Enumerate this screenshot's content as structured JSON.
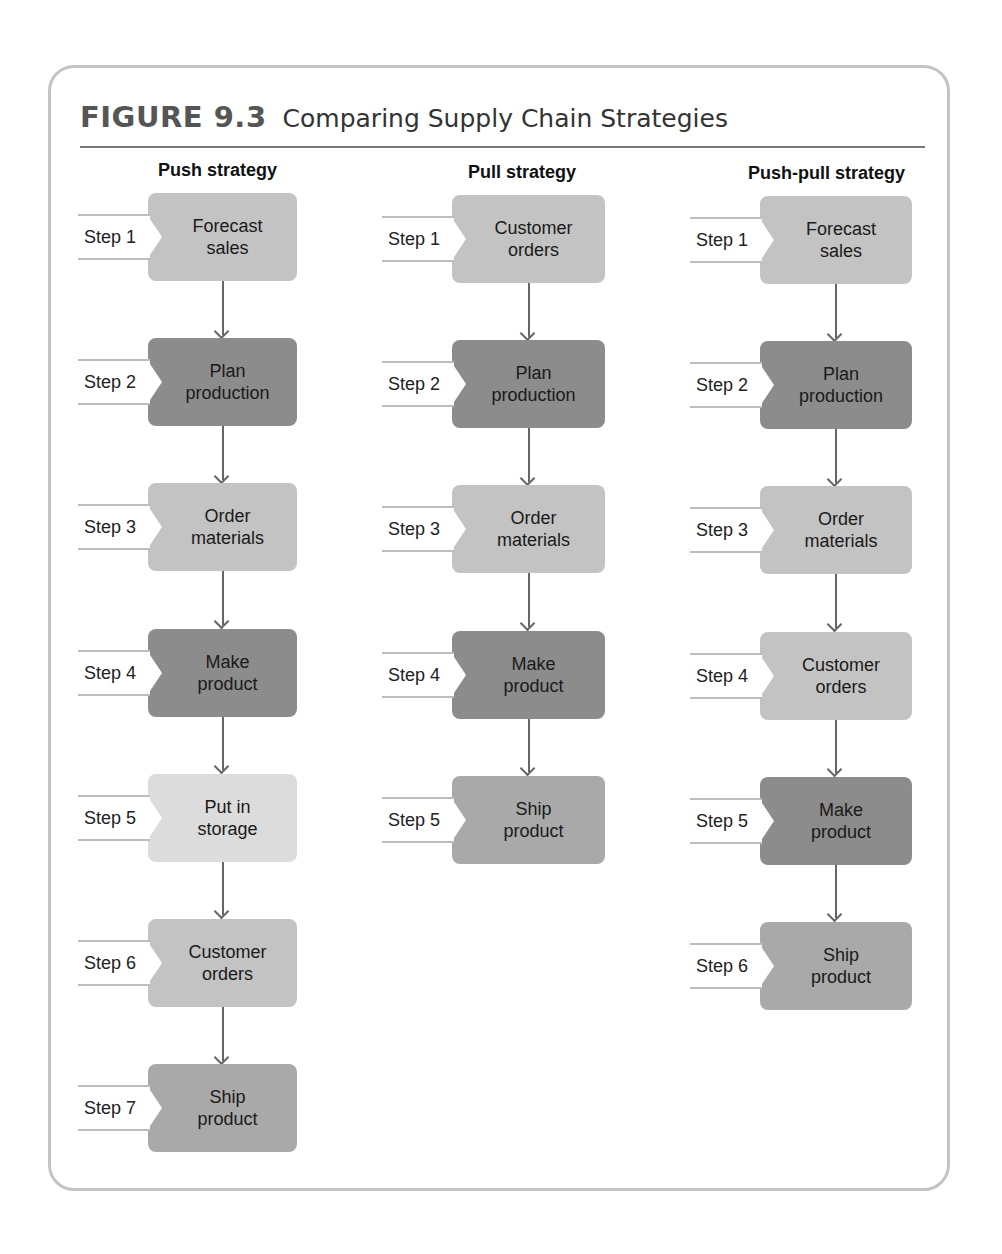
{
  "figure": {
    "number": "FIGURE 9.3",
    "title": "Comparing Supply Chain Strategies"
  },
  "colors": {
    "dark": "#8c8c8c",
    "medium": "#a9a9a9",
    "light": "#c3c3c3",
    "lightest": "#dcdcdc"
  },
  "columns": [
    {
      "heading": "Push strategy",
      "steps": [
        {
          "label": "Step 1",
          "text": "Forecast\nsales",
          "shade": "light"
        },
        {
          "label": "Step 2",
          "text": "Plan\nproduction",
          "shade": "dark"
        },
        {
          "label": "Step 3",
          "text": "Order\nmaterials",
          "shade": "light"
        },
        {
          "label": "Step 4",
          "text": "Make\nproduct",
          "shade": "dark"
        },
        {
          "label": "Step 5",
          "text": "Put in\nstorage",
          "shade": "lightest"
        },
        {
          "label": "Step 6",
          "text": "Customer\norders",
          "shade": "light"
        },
        {
          "label": "Step 7",
          "text": "Ship\nproduct",
          "shade": "medium"
        }
      ]
    },
    {
      "heading": "Pull strategy",
      "steps": [
        {
          "label": "Step 1",
          "text": "Customer\norders",
          "shade": "light"
        },
        {
          "label": "Step 2",
          "text": "Plan\nproduction",
          "shade": "dark"
        },
        {
          "label": "Step 3",
          "text": "Order\nmaterials",
          "shade": "light"
        },
        {
          "label": "Step 4",
          "text": "Make\nproduct",
          "shade": "dark"
        },
        {
          "label": "Step 5",
          "text": "Ship\nproduct",
          "shade": "medium"
        }
      ]
    },
    {
      "heading": "Push-pull strategy",
      "steps": [
        {
          "label": "Step 1",
          "text": "Forecast\nsales",
          "shade": "light"
        },
        {
          "label": "Step 2",
          "text": "Plan\nproduction",
          "shade": "dark"
        },
        {
          "label": "Step 3",
          "text": "Order\nmaterials",
          "shade": "light"
        },
        {
          "label": "Step 4",
          "text": "Customer\norders",
          "shade": "light"
        },
        {
          "label": "Step 5",
          "text": "Make\nproduct",
          "shade": "dark"
        },
        {
          "label": "Step 6",
          "text": "Ship\nproduct",
          "shade": "medium"
        }
      ]
    }
  ]
}
